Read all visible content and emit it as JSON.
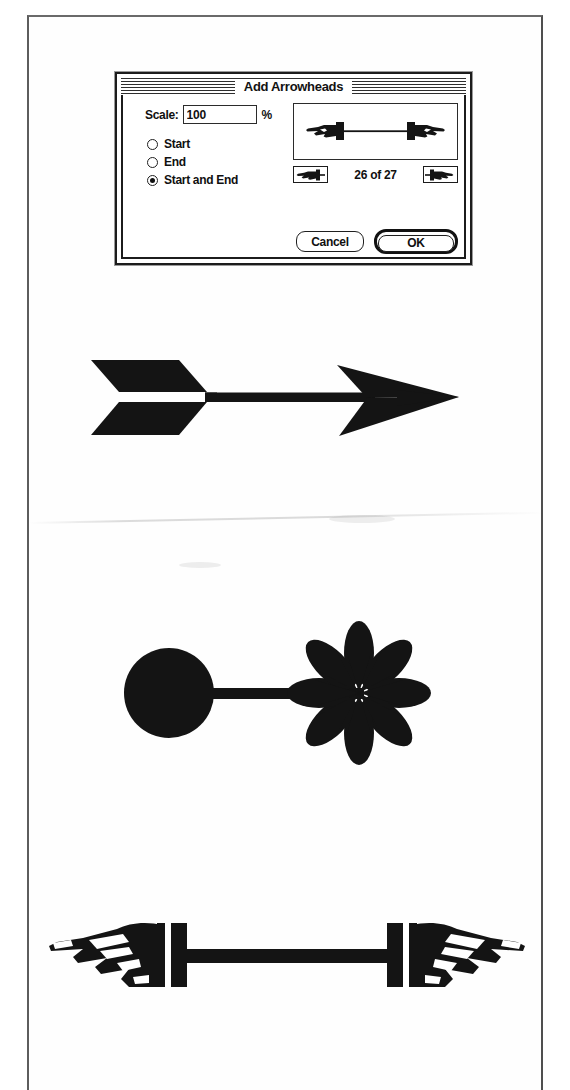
{
  "dialog": {
    "title": "Add Arrowheads",
    "scale": {
      "label": "Scale:",
      "value": "100",
      "placeholder": "100",
      "unit": "%"
    },
    "options": [
      {
        "label": "Start",
        "selected": false
      },
      {
        "label": "End",
        "selected": false
      },
      {
        "label": "Start and End",
        "selected": true
      }
    ],
    "preview": {
      "icon": "double-hand-arrowhead-preview"
    },
    "navigation": {
      "prev_icon": "previous-arrowhead-icon",
      "next_icon": "next-arrowhead-icon",
      "counter": "26 of 27",
      "current": 26,
      "total": 27
    },
    "buttons": {
      "cancel": "Cancel",
      "ok": "OK",
      "default": "OK"
    }
  },
  "samples": [
    {
      "name": "feathered-arrow",
      "description": "Arrow with fletching tail and barbed arrowhead"
    },
    {
      "name": "circle-and-starburst",
      "description": "Filled circle start cap and eight-petal starburst end cap"
    },
    {
      "name": "pointing-hands",
      "description": "Pointing hand arrowheads at both ends of a bar"
    }
  ],
  "colors": {
    "ink": "#121212",
    "page": "#fefefe",
    "border": "#5d5d5d"
  }
}
